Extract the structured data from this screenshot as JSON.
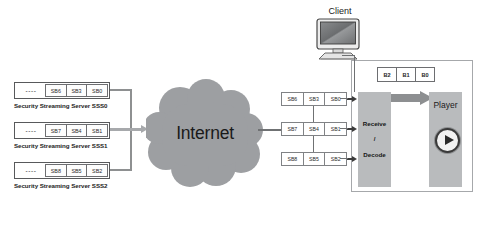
{
  "diagram": {
    "cloud": {
      "label": "Internet"
    },
    "client": {
      "label": "Client",
      "icon": "desktop-monitor-icon"
    },
    "servers": [
      {
        "label": "Security Streaming Server SSS0",
        "dots": "----",
        "blocks": [
          "SB6",
          "SB3",
          "SB0"
        ]
      },
      {
        "label": "Security Streaming Server SSS1",
        "dots": "----",
        "blocks": [
          "SB7",
          "SB4",
          "SB1"
        ]
      },
      {
        "label": "Security Streaming Server SSS2",
        "dots": "----",
        "blocks": [
          "SB8",
          "SB5",
          "SB2"
        ]
      }
    ],
    "received_rows": [
      {
        "blocks": [
          "SB6",
          "SB3",
          "SB0"
        ]
      },
      {
        "blocks": [
          "SB7",
          "SB4",
          "SB1"
        ]
      },
      {
        "blocks": [
          "SB8",
          "SB5",
          "SB2"
        ]
      }
    ],
    "buffer": {
      "blocks": [
        "B2",
        "B1",
        "B0"
      ]
    },
    "decoder": {
      "lines": [
        "Receive",
        "/",
        "Decode"
      ]
    },
    "player": {
      "label": "Player",
      "icon": "play-button-icon"
    },
    "colors": {
      "cloud_fill": "#9d9fa2",
      "block_fill": "#b9bbbd",
      "line": "#8e9091",
      "arrow_dark": "#3c3c3c",
      "border": "#6d6e71"
    }
  }
}
